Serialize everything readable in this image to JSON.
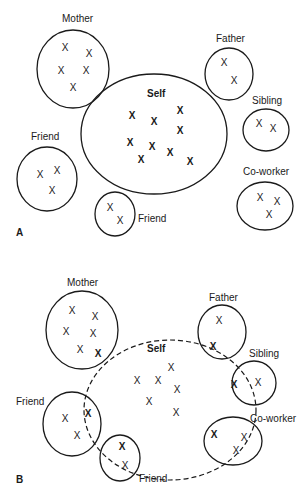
{
  "diagram": {
    "panels": [
      {
        "id": "A",
        "label": "A",
        "description": "Self separate from others",
        "self": {
          "label": "Self",
          "marks": 10
        },
        "others": [
          {
            "id": "mother",
            "label": "Mother",
            "marks": 5
          },
          {
            "id": "father",
            "label": "Father",
            "marks": 2
          },
          {
            "id": "sibling",
            "label": "Sibling",
            "marks": 2
          },
          {
            "id": "friend-left",
            "label": "Friend",
            "marks": 3
          },
          {
            "id": "friend-bottom",
            "label": "Friend",
            "marks": 2
          },
          {
            "id": "coworker",
            "label": "Co-worker",
            "marks": 3
          }
        ]
      },
      {
        "id": "B",
        "label": "B",
        "description": "Self overlapping with others (dashed boundary)",
        "self": {
          "label": "Self",
          "marks": 7
        },
        "others": [
          {
            "id": "mother",
            "label": "Mother",
            "marks": 6
          },
          {
            "id": "father",
            "label": "Father",
            "marks": 2
          },
          {
            "id": "sibling",
            "label": "Sibling",
            "marks": 2
          },
          {
            "id": "friend-left",
            "label": "Friend",
            "marks": 3
          },
          {
            "id": "friend-bottom",
            "label": "Friend",
            "marks": 2
          },
          {
            "id": "coworker",
            "label": "Co-worker",
            "marks": 3
          }
        ]
      }
    ],
    "mark_glyph": "X"
  }
}
